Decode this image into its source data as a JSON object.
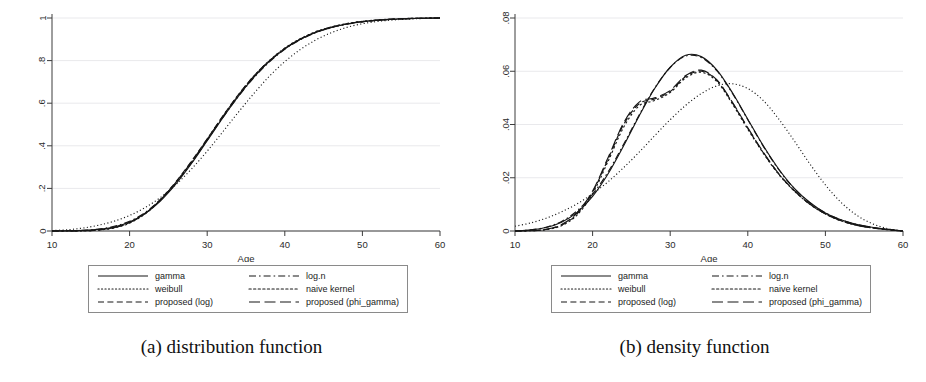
{
  "figure": {
    "panels": [
      {
        "id": "panel-a",
        "caption": "(a) distribution function",
        "legend": {
          "entries": [
            {
              "label": "gamma",
              "style": "solid"
            },
            {
              "label": "log.n",
              "style": "dash-dot"
            },
            {
              "label": "weibull",
              "style": "dotted-fine"
            },
            {
              "label": "naive kernel",
              "style": "dotted-coarse"
            },
            {
              "label": "proposed (log)",
              "style": "dashed"
            },
            {
              "label": "proposed (phi_gamma)",
              "style": "long-dash"
            }
          ]
        }
      },
      {
        "id": "panel-b",
        "caption": "(b) density function",
        "legend": {
          "entries": [
            {
              "label": "gamma",
              "style": "solid"
            },
            {
              "label": "log.n",
              "style": "dash-dot"
            },
            {
              "label": "weibull",
              "style": "dotted-fine"
            },
            {
              "label": "naive kernel",
              "style": "dotted-coarse"
            },
            {
              "label": "proposed (log)",
              "style": "dashed"
            },
            {
              "label": "proposed (phi_gamma)",
              "style": "long-dash"
            }
          ]
        }
      }
    ]
  },
  "chart_data": [
    {
      "type": "line",
      "title": "(a) distribution function",
      "xlabel": "Age",
      "ylabel": "",
      "xlim": [
        10,
        60
      ],
      "ylim": [
        0,
        1
      ],
      "xticks": [
        10,
        20,
        30,
        40,
        50,
        60
      ],
      "yticks": [
        0,
        0.2,
        0.4,
        0.6,
        0.8,
        1
      ],
      "ytick_labels": [
        "0",
        ".2",
        ".4",
        ".6",
        ".8",
        "1"
      ],
      "grid": "faint-horizontal",
      "legend_position": "below-plot",
      "x": [
        10,
        12,
        14,
        16,
        18,
        20,
        22,
        24,
        26,
        28,
        30,
        32,
        34,
        36,
        38,
        40,
        42,
        44,
        46,
        48,
        50,
        52,
        54,
        56,
        58,
        60
      ],
      "series": [
        {
          "name": "gamma",
          "style": "solid",
          "values": [
            0.0,
            0.001,
            0.003,
            0.008,
            0.019,
            0.042,
            0.082,
            0.142,
            0.222,
            0.318,
            0.424,
            0.531,
            0.632,
            0.721,
            0.796,
            0.855,
            0.9,
            0.933,
            0.956,
            0.972,
            0.983,
            0.99,
            0.994,
            0.997,
            0.999,
            1.0
          ]
        },
        {
          "name": "log.n",
          "style": "dash-dot",
          "values": [
            0.0,
            0.001,
            0.003,
            0.009,
            0.022,
            0.046,
            0.087,
            0.148,
            0.228,
            0.322,
            0.427,
            0.532,
            0.631,
            0.719,
            0.793,
            0.853,
            0.898,
            0.931,
            0.955,
            0.971,
            0.982,
            0.989,
            0.994,
            0.997,
            0.999,
            1.0
          ]
        },
        {
          "name": "weibull",
          "style": "dotted-fine",
          "values": [
            0.002,
            0.006,
            0.014,
            0.027,
            0.046,
            0.073,
            0.11,
            0.158,
            0.219,
            0.292,
            0.375,
            0.465,
            0.557,
            0.645,
            0.726,
            0.795,
            0.852,
            0.897,
            0.931,
            0.956,
            0.973,
            0.984,
            0.991,
            0.995,
            0.998,
            1.0
          ]
        },
        {
          "name": "naive kernel",
          "style": "dotted-coarse",
          "values": [
            0.0,
            0.0,
            0.001,
            0.004,
            0.014,
            0.037,
            0.08,
            0.146,
            0.229,
            0.325,
            0.43,
            0.537,
            0.638,
            0.727,
            0.8,
            0.859,
            0.903,
            0.936,
            0.958,
            0.974,
            0.984,
            0.991,
            0.995,
            0.998,
            0.999,
            1.0
          ]
        },
        {
          "name": "proposed (log)",
          "style": "dashed",
          "values": [
            0.0,
            0.0,
            0.001,
            0.005,
            0.016,
            0.04,
            0.084,
            0.15,
            0.233,
            0.329,
            0.433,
            0.539,
            0.639,
            0.727,
            0.799,
            0.857,
            0.901,
            0.934,
            0.957,
            0.973,
            0.983,
            0.99,
            0.995,
            0.998,
            0.999,
            1.0
          ]
        },
        {
          "name": "proposed (phi_gamma)",
          "style": "long-dash",
          "values": [
            0.0,
            0.0,
            0.001,
            0.005,
            0.016,
            0.039,
            0.082,
            0.147,
            0.23,
            0.326,
            0.431,
            0.537,
            0.637,
            0.726,
            0.798,
            0.856,
            0.9,
            0.933,
            0.956,
            0.972,
            0.983,
            0.99,
            0.995,
            0.997,
            0.999,
            1.0
          ]
        }
      ]
    },
    {
      "type": "line",
      "title": "(b) density function",
      "xlabel": "Age",
      "ylabel": "",
      "xlim": [
        10,
        60
      ],
      "ylim": [
        0,
        0.08
      ],
      "xticks": [
        10,
        20,
        30,
        40,
        50,
        60
      ],
      "yticks": [
        0,
        0.02,
        0.04,
        0.06,
        0.08
      ],
      "ytick_labels": [
        "0",
        ".02",
        ".04",
        ".06",
        ".08"
      ],
      "grid": "faint-horizontal",
      "legend_position": "below-plot",
      "x": [
        10,
        12,
        14,
        16,
        18,
        20,
        22,
        24,
        26,
        28,
        30,
        32,
        34,
        36,
        38,
        40,
        42,
        44,
        46,
        48,
        50,
        52,
        54,
        56,
        58,
        60
      ],
      "series": [
        {
          "name": "gamma",
          "style": "solid",
          "values": [
            0.0,
            0.0004,
            0.0013,
            0.0033,
            0.007,
            0.013,
            0.0215,
            0.032,
            0.0432,
            0.0535,
            0.0615,
            0.066,
            0.0655,
            0.0605,
            0.052,
            0.042,
            0.032,
            0.0232,
            0.016,
            0.0107,
            0.0068,
            0.0042,
            0.0025,
            0.0014,
            0.0006,
            0.0
          ]
        },
        {
          "name": "log.n",
          "style": "dash-dot",
          "values": [
            0.0,
            0.0004,
            0.0014,
            0.0036,
            0.0076,
            0.0138,
            0.0222,
            0.0326,
            0.0436,
            0.0537,
            0.0614,
            0.0657,
            0.0652,
            0.0602,
            0.0518,
            0.0418,
            0.0318,
            0.023,
            0.0159,
            0.0106,
            0.0068,
            0.0042,
            0.0025,
            0.0014,
            0.0006,
            0.0
          ]
        },
        {
          "name": "weibull",
          "style": "dotted-fine",
          "values": [
            0.0018,
            0.003,
            0.0048,
            0.0072,
            0.0102,
            0.014,
            0.0185,
            0.0238,
            0.0296,
            0.0358,
            0.0418,
            0.0472,
            0.0516,
            0.0545,
            0.0553,
            0.0535,
            0.049,
            0.042,
            0.0338,
            0.0252,
            0.0173,
            0.0108,
            0.006,
            0.0028,
            0.0009,
            0.0
          ]
        },
        {
          "name": "naive kernel",
          "style": "dotted-coarse",
          "values": [
            0.0,
            0.0001,
            0.0005,
            0.002,
            0.006,
            0.014,
            0.0262,
            0.039,
            0.047,
            0.049,
            0.052,
            0.0575,
            0.0596,
            0.0562,
            0.0478,
            0.0382,
            0.0292,
            0.0212,
            0.015,
            0.01,
            0.0064,
            0.0038,
            0.0022,
            0.0012,
            0.0005,
            0.0
          ]
        },
        {
          "name": "proposed (log)",
          "style": "dashed",
          "values": [
            0.0,
            0.0001,
            0.0006,
            0.0022,
            0.0064,
            0.0146,
            0.027,
            0.04,
            0.0478,
            0.0496,
            0.0524,
            0.058,
            0.06,
            0.0566,
            0.0482,
            0.0386,
            0.0294,
            0.0214,
            0.0151,
            0.0101,
            0.0064,
            0.0039,
            0.0022,
            0.0012,
            0.0005,
            0.0
          ]
        },
        {
          "name": "proposed (phi_gamma)",
          "style": "long-dash",
          "values": [
            0.0,
            0.0001,
            0.0006,
            0.0024,
            0.0068,
            0.015,
            0.0276,
            0.0406,
            0.0484,
            0.05,
            0.0528,
            0.0584,
            0.0604,
            0.0568,
            0.0484,
            0.0388,
            0.0296,
            0.0215,
            0.0152,
            0.0101,
            0.0065,
            0.0039,
            0.0022,
            0.0012,
            0.0005,
            0.0
          ]
        }
      ]
    }
  ]
}
